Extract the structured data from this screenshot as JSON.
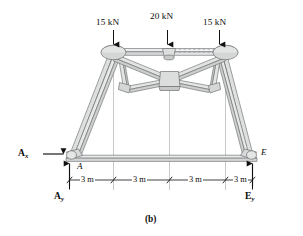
{
  "figure": {
    "caption": "(b)",
    "type": "truss-free-body-diagram",
    "colors": {
      "member_fill": "#dcdddd",
      "member_fill_light": "#ebecec",
      "member_stroke": "#6f7173",
      "gusset_fill": "#d2d4d4",
      "line": "#1a1a1a",
      "gridline": "#b9babb",
      "background": "#ffffff"
    }
  },
  "loads": [
    {
      "id": "load-left",
      "label": "15 kN",
      "magnitude": 15,
      "unit": "kN",
      "direction": "down",
      "at_node": "B"
    },
    {
      "id": "load-center",
      "label": "20 kN",
      "magnitude": 20,
      "unit": "kN",
      "direction": "down",
      "at_node": "C"
    },
    {
      "id": "load-right",
      "label": "15 kN",
      "magnitude": 15,
      "unit": "kN",
      "direction": "down",
      "at_node": "D"
    }
  ],
  "reactions": [
    {
      "id": "reaction-ax",
      "symbol": "A",
      "subscript": "x",
      "direction": "right",
      "at_node": "A"
    },
    {
      "id": "reaction-ay",
      "symbol": "A",
      "subscript": "y",
      "direction": "up",
      "at_node": "A"
    },
    {
      "id": "reaction-ey",
      "symbol": "E",
      "subscript": "y",
      "direction": "up",
      "at_node": "E"
    }
  ],
  "joint_labels": [
    {
      "id": "joint-a",
      "label": "A"
    },
    {
      "id": "joint-e",
      "label": "E"
    }
  ],
  "dimensions": {
    "unit": "m",
    "segments": [
      {
        "id": "dim-1",
        "label": "3 m",
        "value": 3
      },
      {
        "id": "dim-2",
        "label": "3 m",
        "value": 3
      },
      {
        "id": "dim-3",
        "label": "3 m",
        "value": 3
      },
      {
        "id": "dim-4",
        "label": "3 m",
        "value": 3
      }
    ],
    "total_label": "12 m",
    "total_value": 12
  }
}
